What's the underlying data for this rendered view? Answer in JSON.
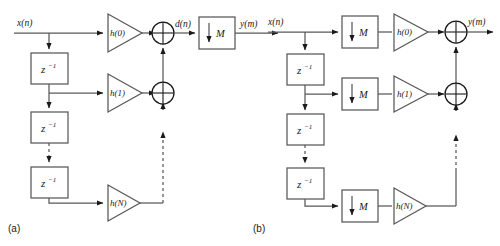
{
  "figure": {
    "background_color": "#ffffff",
    "line_color": "#58585a",
    "marker_color": "#1a1a1a"
  },
  "panels": [
    {
      "id": "a",
      "caption": "(a)",
      "input_label": "x(n)",
      "output_label": "y(m)",
      "intermediate_label": "d(n)",
      "delay_label_base": "z",
      "delay_label_exp": "−1",
      "delay_count": 3,
      "downsampler_label": "M",
      "downsampler_arrow": "↓",
      "filters": [
        "h(0)",
        "h(1)",
        "h(N)"
      ],
      "adders": 3,
      "order": "filter-then-decimate"
    },
    {
      "id": "b",
      "caption": "(b)",
      "input_label": "x(n)",
      "output_label": "y(m)",
      "delay_label_base": "z",
      "delay_label_exp": "−1",
      "delay_count": 3,
      "downsampler_label": "M",
      "downsampler_arrow": "↓",
      "downsampler_count": 3,
      "filters": [
        "h(0)",
        "h(1)",
        "h(N)"
      ],
      "adders": 2,
      "order": "decimate-then-filter"
    }
  ]
}
